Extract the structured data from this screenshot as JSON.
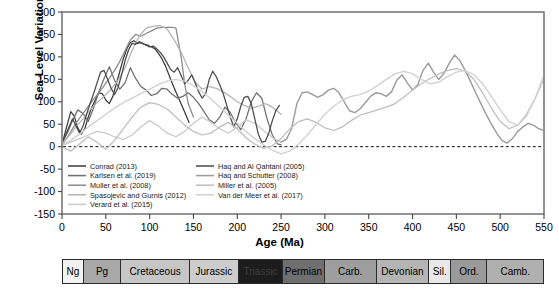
{
  "axes": {
    "ylabel": "Sea-Level Variations (m)",
    "xlabel": "Age (Ma)",
    "ylim": [
      -150,
      300
    ],
    "xlim": [
      0,
      550
    ],
    "yticks": [
      300,
      250,
      200,
      150,
      100,
      50,
      0,
      -50,
      -100,
      -150
    ],
    "xticks": [
      0,
      50,
      100,
      150,
      200,
      250,
      300,
      350,
      400,
      450,
      500,
      550
    ],
    "zero_line": 0,
    "zero_line_style": "dashed",
    "grid": false
  },
  "legend": {
    "position": "lower-left-inside",
    "columns": 2,
    "entries": [
      {
        "label": "Conrad (2013)",
        "color": "#3a3a3a",
        "column": 0
      },
      {
        "label": "Karlsen et al. (2019)",
        "color": "#6e6e6e",
        "column": 0
      },
      {
        "label": "Muller et al. (2008)",
        "color": "#8a8a8a",
        "column": 0
      },
      {
        "label": "Spasojevic and Gurnis (2012)",
        "color": "#b4b4b4",
        "column": 0
      },
      {
        "label": "Verard et al. (2015)",
        "color": "#c9c9c9",
        "column": 0
      },
      {
        "label": "Haq and Al Qahtani (2005)",
        "color": "#4a4a4a",
        "column": 1
      },
      {
        "label": "Haq and Schutter (2008)",
        "color": "#9a9a9a",
        "column": 1
      },
      {
        "label": "Miller et al. (2005)",
        "color": "#bdbdbd",
        "column": 1
      },
      {
        "label": "Van der Meer et al. (2017)",
        "color": "#d2d2d2",
        "column": 1
      }
    ]
  },
  "timescale": {
    "title": "Age (Ma)",
    "periods": [
      {
        "label": "Ng",
        "start": 0,
        "end": 23,
        "color": "#f2f2f2",
        "text_color": "#000000"
      },
      {
        "label": "Pg",
        "start": 23,
        "end": 66,
        "color": "#a8a8a8",
        "text_color": "#000000"
      },
      {
        "label": "Cretaceous",
        "start": 66,
        "end": 145,
        "color": "#c6c6c6",
        "text_color": "#000000"
      },
      {
        "label": "Jurassic",
        "start": 145,
        "end": 201,
        "color": "#cdcdcd",
        "text_color": "#000000"
      },
      {
        "label": "Triassic",
        "start": 201,
        "end": 252,
        "color": "#1c1c1c",
        "text_color": "#3c3c3c"
      },
      {
        "label": "Permian",
        "start": 252,
        "end": 299,
        "color": "#6f6f6f",
        "text_color": "#000000"
      },
      {
        "label": "Carb.",
        "start": 299,
        "end": 359,
        "color": "#9e9e9e",
        "text_color": "#000000"
      },
      {
        "label": "Devonian",
        "start": 359,
        "end": 419,
        "color": "#b5b5b5",
        "text_color": "#000000"
      },
      {
        "label": "Sil.",
        "start": 419,
        "end": 444,
        "color": "#e8e8e8",
        "text_color": "#000000"
      },
      {
        "label": "Ord.",
        "start": 444,
        "end": 485,
        "color": "#9a9a9a",
        "text_color": "#000000"
      },
      {
        "label": "Camb.",
        "start": 485,
        "end": 550,
        "color": "#b0b0b0",
        "text_color": "#000000"
      }
    ]
  },
  "chart_data": {
    "type": "line",
    "title": "",
    "xlabel": "Age (Ma)",
    "ylabel": "Sea-Level Variations (m)",
    "xlim": [
      0,
      550
    ],
    "ylim": [
      -150,
      300
    ],
    "series": [
      {
        "name": "Conrad (2013)",
        "color": "#3a3a3a",
        "width": 1.25,
        "x": [
          0,
          5,
          10,
          14,
          18,
          22,
          26,
          30,
          34,
          38,
          42,
          46,
          50,
          54,
          58,
          62,
          66,
          70,
          74,
          78,
          82,
          86,
          90,
          94,
          98,
          102,
          106,
          110,
          114,
          118,
          122,
          126,
          130,
          134,
          138,
          142,
          145
        ],
        "y": [
          5,
          42,
          78,
          68,
          42,
          28,
          40,
          66,
          88,
          104,
          120,
          118,
          104,
          96,
          112,
          140,
          168,
          196,
          218,
          232,
          236,
          230,
          232,
          228,
          226,
          222,
          218,
          208,
          196,
          180,
          160,
          140,
          122,
          104,
          86,
          68,
          54
        ]
      },
      {
        "name": "Karlsen et al. (2019)",
        "color": "#6e6e6e",
        "width": 1.25,
        "x": [
          0,
          6,
          12,
          18,
          24,
          30,
          36,
          42,
          48,
          54,
          60,
          66,
          72,
          78,
          84,
          90,
          96,
          102,
          108,
          114,
          120,
          126,
          132,
          138,
          144,
          150,
          156,
          162,
          168,
          174,
          180,
          186,
          192,
          198,
          204,
          210,
          216,
          222,
          228,
          234,
          240,
          246,
          250
        ],
        "y": [
          8,
          30,
          58,
          82,
          74,
          56,
          86,
          122,
          152,
          178,
          148,
          128,
          142,
          176,
          152,
          134,
          126,
          114,
          118,
          130,
          128,
          116,
          108,
          112,
          120,
          110,
          96,
          78,
          60,
          52,
          66,
          88,
          76,
          54,
          38,
          62,
          100,
          120,
          108,
          62,
          26,
          6,
          4
        ]
      },
      {
        "name": "Muller et al. (2008)",
        "color": "#8a8a8a",
        "width": 1.25,
        "x": [
          0,
          6,
          12,
          18,
          24,
          30,
          36,
          42,
          48,
          54,
          60,
          66,
          72,
          78,
          84,
          90,
          96,
          102,
          108,
          114,
          120,
          126,
          130,
          136,
          140,
          144,
          150
        ],
        "y": [
          4,
          20,
          40,
          58,
          74,
          90,
          106,
          120,
          136,
          152,
          170,
          190,
          214,
          238,
          250,
          246,
          252,
          258,
          264,
          266,
          266,
          266,
          264,
          200,
          140,
          96,
          66
        ]
      },
      {
        "name": "Spasojevic and Gurnis (2012)",
        "color": "#b4b4b4",
        "width": 1.25,
        "x": [
          0,
          8,
          16,
          24,
          32,
          40,
          48,
          56,
          64,
          72,
          80,
          88,
          96,
          104,
          112,
          120,
          128,
          136,
          144,
          152,
          160,
          168,
          176,
          184,
          192,
          200,
          208,
          216,
          224,
          232,
          240,
          250
        ],
        "y": [
          6,
          24,
          44,
          62,
          82,
          98,
          112,
          128,
          148,
          176,
          214,
          246,
          264,
          268,
          270,
          262,
          238,
          210,
          176,
          144,
          128,
          134,
          130,
          122,
          112,
          100,
          92,
          86,
          90,
          96,
          88,
          72
        ]
      },
      {
        "name": "Verard et al. (2015)",
        "color": "#c9c9c9",
        "width": 1.25,
        "x": [
          0,
          10,
          20,
          30,
          40,
          50,
          60,
          70,
          80,
          90,
          100,
          110,
          120,
          130,
          140,
          150,
          160,
          170,
          180,
          190,
          200,
          210,
          220,
          230,
          240,
          250
        ],
        "y": [
          2,
          10,
          18,
          26,
          34,
          30,
          22,
          16,
          26,
          44,
          58,
          46,
          30,
          22,
          34,
          52,
          66,
          54,
          40,
          30,
          44,
          60,
          52,
          36,
          20,
          10
        ]
      },
      {
        "name": "Haq and Al Qahtani (2005)",
        "color": "#4a4a4a",
        "width": 1.25,
        "x": [
          0,
          4,
          8,
          12,
          16,
          20,
          24,
          28,
          32,
          36,
          40,
          44,
          48,
          52,
          56,
          60,
          64,
          68,
          72,
          76,
          80,
          84,
          88,
          92,
          96,
          100,
          104,
          108,
          112,
          116,
          120,
          124,
          128,
          132,
          136,
          140,
          144,
          148,
          152,
          156,
          160,
          164,
          168,
          172,
          176,
          180,
          184,
          188,
          192,
          196,
          200,
          204,
          208,
          212,
          216,
          220,
          224,
          228,
          232,
          236,
          240,
          244,
          248
        ],
        "y": [
          8,
          26,
          44,
          62,
          46,
          30,
          46,
          72,
          96,
          118,
          142,
          166,
          170,
          150,
          130,
          116,
          132,
          160,
          192,
          216,
          230,
          228,
          234,
          230,
          226,
          222,
          224,
          218,
          210,
          200,
          186,
          172,
          166,
          176,
          158,
          140,
          148,
          160,
          142,
          122,
          108,
          118,
          150,
          168,
          156,
          138,
          118,
          92,
          66,
          44,
          62,
          90,
          110,
          112,
          96,
          62,
          28,
          10,
          12,
          30,
          58,
          80,
          92
        ]
      },
      {
        "name": "Haq and Schutter (2008)",
        "color": "#9a9a9a",
        "width": 1.4,
        "x": [
          250,
          256,
          262,
          268,
          274,
          280,
          286,
          292,
          298,
          304,
          310,
          316,
          322,
          328,
          334,
          340,
          346,
          352,
          358,
          364,
          370,
          376,
          382,
          388,
          394,
          400,
          406,
          412,
          418,
          424,
          430,
          436,
          442,
          448,
          454,
          460,
          466,
          472,
          478,
          484,
          490,
          496,
          502,
          508,
          514,
          520,
          526,
          532,
          538,
          544,
          550
        ],
        "y": [
          10,
          16,
          40,
          96,
          120,
          122,
          116,
          110,
          116,
          126,
          130,
          120,
          100,
          80,
          76,
          84,
          98,
          112,
          120,
          118,
          112,
          122,
          148,
          160,
          142,
          126,
          138,
          170,
          186,
          166,
          150,
          164,
          186,
          204,
          192,
          170,
          146,
          120,
          96,
          72,
          50,
          30,
          14,
          8,
          18,
          34,
          44,
          52,
          48,
          40,
          36
        ]
      },
      {
        "name": "Miller et al. (2005)",
        "color": "#bdbdbd",
        "width": 1.25,
        "x": [
          0,
          10,
          20,
          30,
          40,
          50,
          60,
          70,
          80,
          90,
          100,
          110,
          120,
          130,
          140,
          150,
          160,
          170,
          180,
          190,
          200,
          210,
          220,
          230,
          240,
          250,
          260,
          270,
          280,
          290,
          300,
          310,
          320,
          330,
          340,
          350,
          360,
          370,
          380,
          390,
          400,
          410,
          420,
          430,
          440,
          450,
          460,
          470,
          480,
          490,
          500,
          510,
          520,
          530,
          540,
          550
        ],
        "y": [
          0,
          -10,
          6,
          22,
          10,
          -6,
          14,
          40,
          66,
          88,
          98,
          94,
          84,
          66,
          48,
          34,
          26,
          30,
          44,
          54,
          40,
          20,
          6,
          -4,
          2,
          18,
          40,
          56,
          62,
          54,
          42,
          36,
          44,
          58,
          70,
          76,
          82,
          88,
          96,
          110,
          126,
          140,
          152,
          162,
          170,
          174,
          168,
          150,
          120,
          86,
          56,
          40,
          48,
          72,
          108,
          152
        ]
      },
      {
        "name": "Van der Meer et al. (2017)",
        "color": "#d2d2d2",
        "width": 1.4,
        "x": [
          0,
          10,
          20,
          30,
          40,
          50,
          60,
          70,
          80,
          90,
          100,
          110,
          120,
          130,
          140,
          150,
          160,
          170,
          180,
          190,
          200,
          210,
          220,
          230,
          240,
          250,
          260,
          270,
          280,
          290,
          300,
          310,
          320,
          330,
          340,
          350,
          360,
          370,
          380,
          390,
          400,
          410,
          420,
          430,
          440,
          450,
          460,
          470,
          480,
          490,
          500,
          510,
          520,
          530,
          540,
          550
        ],
        "y": [
          4,
          14,
          28,
          44,
          58,
          72,
          86,
          98,
          108,
          118,
          128,
          138,
          146,
          150,
          146,
          136,
          122,
          106,
          88,
          70,
          52,
          34,
          18,
          4,
          -8,
          -16,
          -10,
          6,
          26,
          50,
          72,
          90,
          104,
          112,
          116,
          124,
          136,
          150,
          162,
          168,
          162,
          150,
          140,
          144,
          156,
          166,
          170,
          160,
          140,
          112,
          82,
          56,
          48,
          68,
          108,
          160
        ]
      }
    ]
  }
}
